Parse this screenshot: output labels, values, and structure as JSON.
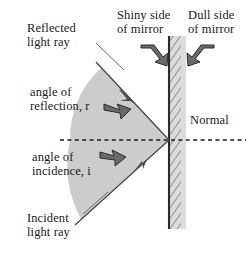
{
  "diagram": {
    "labels": {
      "reflected_ray": "Reflected\nlight ray",
      "shiny_side": "Shiny side\nof mirror",
      "dull_side": "Dull side\nof mirror",
      "angle_of_reflection": "angle of\nreflection, r",
      "angle_of_incidence": "angle of\nincidence, i",
      "normal": "Normal",
      "incident_ray": "Incident\nlight ray"
    },
    "colors": {
      "background": "#ffffff",
      "ink": "#1a1a1a",
      "ray_line": "#4a4a4a",
      "wedge_fill": "#c8c8c8",
      "mirror_line": "#2b2b2b",
      "mirror_band": "#d9d9d9",
      "hatch": "#555555",
      "arrow_fill": "#5a5a5a",
      "arrow_outline": "#2b2b2b"
    },
    "geometry": {
      "mirror_x": 169,
      "mirror_top_y": 36,
      "mirror_bottom_y": 229,
      "mirror_band_width": 16,
      "incidence_point": [
        169,
        140
      ],
      "normal_y": 140,
      "normal_left_x": 60,
      "normal_right_x": 246,
      "reflected_ray_end": [
        96,
        62
      ],
      "incident_ray_start": [
        75,
        225
      ]
    }
  }
}
